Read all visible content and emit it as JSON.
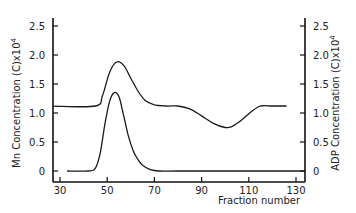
{
  "chart_data": {
    "type": "line",
    "title": "",
    "xlabel": "Fraction number",
    "ylabel_left": "Mn Concentration (C)x10^4",
    "ylabel_right": "ADP Concentration (C)x10^4",
    "left_axis": {
      "title_main": "Mn Concentration (C)x10",
      "title_sup": "4"
    },
    "right_axis": {
      "title_main": "ADP Concentration (C)x10",
      "title_sup": "4"
    },
    "xlim": [
      27,
      134
    ],
    "ylim": [
      -0.1,
      2.65
    ],
    "x_ticks": [
      30,
      50,
      70,
      90,
      110,
      130
    ],
    "x_tick_labels": [
      "30",
      "50",
      "70",
      "90",
      "110",
      "130"
    ],
    "y_ticks": [
      0,
      0.5,
      1.0,
      1.5,
      2.0,
      2.5
    ],
    "y_tick_labels": [
      "0",
      "0.5",
      "1.0",
      "1.5",
      "2.0",
      "2.5"
    ],
    "grid": false,
    "legend": null,
    "series": [
      {
        "name": "ADP (upper curve, right axis)",
        "axis": "right",
        "x": [
          27,
          45,
          48,
          51,
          54,
          57,
          60,
          63,
          66,
          70,
          75,
          80,
          85,
          90,
          95,
          100,
          103,
          107,
          111,
          115,
          120,
          126
        ],
        "values": [
          1.12,
          1.12,
          1.3,
          1.7,
          1.88,
          1.82,
          1.6,
          1.38,
          1.22,
          1.14,
          1.12,
          1.12,
          1.07,
          0.95,
          0.82,
          0.75,
          0.77,
          0.88,
          1.02,
          1.12,
          1.12,
          1.12
        ]
      },
      {
        "name": "Mn (lower curve, left axis)",
        "axis": "left",
        "x": [
          33,
          42,
          45,
          47,
          49,
          51,
          53,
          55,
          57,
          59,
          61,
          63,
          65,
          68,
          72,
          80,
          100,
          134
        ],
        "values": [
          0,
          0,
          0.05,
          0.3,
          0.8,
          1.2,
          1.35,
          1.28,
          0.95,
          0.6,
          0.35,
          0.2,
          0.1,
          0.03,
          0.0,
          0,
          0,
          0
        ]
      }
    ]
  }
}
